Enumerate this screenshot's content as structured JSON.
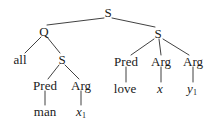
{
  "figure": {
    "type": "syntax-tree",
    "background_color": "#ffffff",
    "line_color": "#2b2b2b"
  },
  "nodes": [
    {
      "id": "s-root",
      "label": "S",
      "kind": "category",
      "x": 108,
      "y": 12
    },
    {
      "id": "q-left",
      "label": "Q",
      "kind": "category",
      "x": 44,
      "y": 31
    },
    {
      "id": "s-right",
      "label": "S",
      "kind": "category",
      "x": 158,
      "y": 33
    },
    {
      "id": "all-left",
      "label": "all",
      "kind": "word",
      "x": 20,
      "y": 59
    },
    {
      "id": "s-inner",
      "label": "S",
      "kind": "category",
      "x": 62,
      "y": 59
    },
    {
      "id": "pred-right",
      "label": "Pred",
      "kind": "category",
      "x": 126,
      "y": 61
    },
    {
      "id": "arg-right-1",
      "label": "Arg",
      "kind": "category",
      "x": 161,
      "y": 61
    },
    {
      "id": "arg-right-2",
      "label": "Arg",
      "kind": "category",
      "x": 193,
      "y": 61
    },
    {
      "id": "pred-left",
      "label": "Pred",
      "kind": "category",
      "x": 45,
      "y": 85
    },
    {
      "id": "arg-left",
      "label": "Arg",
      "kind": "category",
      "x": 81,
      "y": 85
    },
    {
      "id": "love",
      "label": "love",
      "kind": "word",
      "x": 125,
      "y": 88
    },
    {
      "id": "var-x",
      "label": "x",
      "kind": "variable",
      "subscript": "",
      "x": 160,
      "y": 88
    },
    {
      "id": "var-y1",
      "label": "y",
      "kind": "variable",
      "subscript": "1",
      "x": 192,
      "y": 88
    },
    {
      "id": "man",
      "label": "man",
      "kind": "word",
      "x": 45,
      "y": 111
    },
    {
      "id": "var-x1",
      "label": "x",
      "kind": "variable",
      "subscript": "1",
      "x": 81,
      "y": 111
    }
  ],
  "edges": [
    {
      "from": "s-root",
      "to": "q-left",
      "x1": 104,
      "y1": 18,
      "x2": 47,
      "y2": 25
    },
    {
      "from": "s-root",
      "to": "s-right",
      "x1": 112,
      "y1": 18,
      "x2": 155,
      "y2": 27
    },
    {
      "from": "q-left",
      "to": "all-left",
      "x1": 41,
      "y1": 37,
      "x2": 25,
      "y2": 53
    },
    {
      "from": "q-left",
      "to": "s-inner",
      "x1": 47,
      "y1": 37,
      "x2": 60,
      "y2": 53
    },
    {
      "from": "s-right",
      "to": "pred-right",
      "x1": 154,
      "y1": 39,
      "x2": 131,
      "y2": 55
    },
    {
      "from": "s-right",
      "to": "arg-right-1",
      "x1": 159,
      "y1": 39,
      "x2": 161,
      "y2": 55
    },
    {
      "from": "s-right",
      "to": "arg-right-2",
      "x1": 163,
      "y1": 39,
      "x2": 189,
      "y2": 55
    },
    {
      "from": "s-inner",
      "to": "pred-left",
      "x1": 59,
      "y1": 65,
      "x2": 48,
      "y2": 79
    },
    {
      "from": "s-inner",
      "to": "arg-left",
      "x1": 65,
      "y1": 65,
      "x2": 79,
      "y2": 79
    },
    {
      "from": "pred-right",
      "to": "love",
      "x1": 126,
      "y1": 67,
      "x2": 126,
      "y2": 82
    },
    {
      "from": "arg-right-1",
      "to": "var-x",
      "x1": 161,
      "y1": 67,
      "x2": 161,
      "y2": 82
    },
    {
      "from": "arg-right-2",
      "to": "var-y1",
      "x1": 193,
      "y1": 67,
      "x2": 193,
      "y2": 82
    },
    {
      "from": "pred-left",
      "to": "man",
      "x1": 45,
      "y1": 91,
      "x2": 45,
      "y2": 105
    },
    {
      "from": "arg-left",
      "to": "var-x1",
      "x1": 81,
      "y1": 91,
      "x2": 81,
      "y2": 105
    }
  ]
}
